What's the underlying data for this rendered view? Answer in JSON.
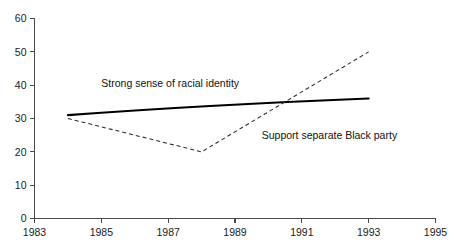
{
  "chart_data": {
    "type": "line",
    "title": "",
    "subtitle": "",
    "xlabel": "",
    "ylabel": "",
    "xlim": [
      1983,
      1995
    ],
    "ylim": [
      0,
      60
    ],
    "grid": false,
    "legend_position": "inline-annotations",
    "x_ticks": [
      "1983",
      "1985",
      "1987",
      "1989",
      "1991",
      "1993",
      "1995"
    ],
    "x_tick_values": [
      1983,
      1985,
      1987,
      1989,
      1991,
      1993,
      1995
    ],
    "y_ticks": [
      "0",
      "10",
      "20",
      "30",
      "40",
      "50",
      "60"
    ],
    "y_tick_values": [
      0,
      10,
      20,
      30,
      40,
      50,
      60
    ],
    "series": [
      {
        "name": "Strong sense of racial identity",
        "style": "solid",
        "color": "#000000",
        "x": [
          1984,
          1988,
          1993
        ],
        "values": [
          31,
          34,
          36
        ]
      },
      {
        "name": "Support separate Black party",
        "style": "dashed",
        "color": "#2b2b2b",
        "x": [
          1984,
          1988,
          1993
        ],
        "values": [
          30,
          20,
          50
        ]
      }
    ],
    "annotations": [
      {
        "text": "Strong sense of racial identity",
        "x": 1985.0,
        "y": 39.5,
        "anchor": "start"
      },
      {
        "text": "Support separate Black party",
        "x": 1989.8,
        "y": 23.8,
        "anchor": "start"
      }
    ]
  }
}
